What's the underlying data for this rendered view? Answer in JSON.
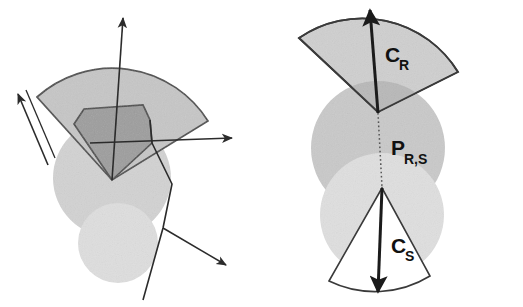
{
  "figure": {
    "kind": "diagram",
    "title": "",
    "background_color": "#ffffff",
    "width": 523,
    "height": 307,
    "panels": [
      {
        "name": "left-panel",
        "caption": "",
        "description": "Unlabelled cone/sector construction with direction arrows",
        "shapes": [
          {
            "name": "upper-sphere",
            "type": "circle",
            "fill": "#d2d2d2"
          },
          {
            "name": "lower-sphere",
            "type": "circle",
            "fill": "#dedede"
          },
          {
            "name": "upper-sector",
            "type": "sector",
            "fill": "#c6c6c6",
            "stroke": "#4a4a4a"
          },
          {
            "name": "overlap-polygon",
            "type": "polygon",
            "fill": "#9d9d9d",
            "stroke": "#4a4a4a"
          }
        ],
        "arrows": [
          {
            "name": "axis-arrow-up",
            "direction": "up"
          },
          {
            "name": "tangent-arrow-upleft",
            "direction": "up-left"
          },
          {
            "name": "tangent-arrow-right",
            "direction": "right"
          },
          {
            "name": "tangent-arrow-downright",
            "direction": "down-right"
          }
        ]
      },
      {
        "name": "right-panel",
        "caption": "",
        "description": "Labelled cone pair C_R and C_S joined through the point P_R,S",
        "shapes": [
          {
            "name": "sphere-r",
            "type": "circle",
            "fill": "#c9c9c9"
          },
          {
            "name": "sphere-s",
            "type": "circle",
            "fill": "#dfdfdf"
          },
          {
            "name": "cone-r-sector",
            "type": "sector",
            "fill": "#cfcfcf",
            "stroke": "#3a3a3a"
          },
          {
            "name": "cone-s-sector",
            "type": "sector",
            "fill": "#ffffff",
            "stroke": "#3a3a3a"
          },
          {
            "name": "connector-line",
            "type": "dotted-line",
            "stroke": "#555555"
          }
        ],
        "arrows": [
          {
            "name": "cone-r-axis-arrow",
            "direction": "up",
            "label_key": "cone_r"
          },
          {
            "name": "cone-s-axis-arrow",
            "direction": "down",
            "label_key": "cone_s"
          }
        ],
        "labels": {
          "cone_r": {
            "base": "C",
            "sub": "R"
          },
          "cone_s": {
            "base": "C",
            "sub": "S"
          },
          "point_rs": {
            "base": "P",
            "sub": "R,S"
          }
        }
      }
    ],
    "colors": {
      "ink": "#111111",
      "stroke_dark": "#3a3a3a",
      "stroke_mid": "#4a4a4a",
      "fill_sector_light": "#c6c6c6",
      "fill_sector_mid": "#cfcfcf",
      "fill_polygon_dark": "#9d9d9d",
      "fill_sphere_dark": "#c9c9c9",
      "fill_sphere_light": "#dfdfdf",
      "fill_white": "#ffffff"
    }
  }
}
